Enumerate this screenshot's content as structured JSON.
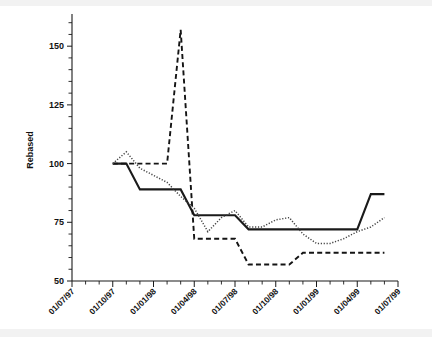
{
  "chart_data": {
    "type": "line",
    "title": "",
    "subtitle": "",
    "xlabel": "",
    "ylabel": "Rebased",
    "ylim": [
      50,
      162
    ],
    "xlim": [
      "01/07/97",
      "01/07/99"
    ],
    "grid": false,
    "legend": "none",
    "y_ticks": [
      50,
      75,
      100,
      125,
      150
    ],
    "y_tick_labels": [
      "50",
      "75",
      "100",
      "125",
      "150"
    ],
    "y_minor_tick_step": 5,
    "x_ticks": [
      "01/07/97",
      "01/10/97",
      "01/01/98",
      "01/04/98",
      "01/07/98",
      "01/10/98",
      "01/01/99",
      "01/04/99",
      "01/07/99"
    ],
    "x_tick_labels": [
      "01/07/97",
      "01/10/97",
      "01/01/98",
      "01/04/98",
      "01/07/98",
      "01/10/98",
      "01/01/99",
      "01/04/99",
      "01/07/99"
    ],
    "x_minor_tick_step_months": 1,
    "x_label_rotation_deg": -45,
    "x_months": [
      "01/10/97",
      "01/11/97",
      "01/12/97",
      "01/01/98",
      "01/02/98",
      "01/03/98",
      "01/04/98",
      "01/05/98",
      "01/06/98",
      "01/07/98",
      "01/08/98",
      "01/09/98",
      "01/10/98",
      "01/11/98",
      "01/12/98",
      "01/01/99",
      "01/02/99",
      "01/03/99",
      "01/04/99",
      "01/05/99",
      "01/06/99"
    ],
    "series": [
      {
        "name": "solid-series",
        "style": "solid",
        "color": "#1a1a1a",
        "values": [
          100,
          100,
          89,
          89,
          89,
          89,
          78,
          78,
          78,
          78,
          72,
          72,
          72,
          72,
          72,
          72,
          72,
          72,
          72,
          87,
          87
        ]
      },
      {
        "name": "dashed-series",
        "style": "dashed",
        "color": "#141414",
        "values": [
          100,
          100,
          100,
          100,
          100,
          157,
          68,
          68,
          68,
          68,
          57,
          57,
          57,
          57,
          62,
          62,
          62,
          62,
          62,
          62,
          62
        ]
      },
      {
        "name": "dotted-series",
        "style": "dotted",
        "color": "#444444",
        "values": [
          100,
          105,
          98,
          95,
          92,
          86,
          81,
          71,
          77,
          80,
          73,
          73,
          76,
          77,
          70,
          66,
          66,
          68,
          71,
          73,
          77
        ]
      }
    ]
  },
  "axes": {
    "y_axis_title": "Rebased"
  }
}
